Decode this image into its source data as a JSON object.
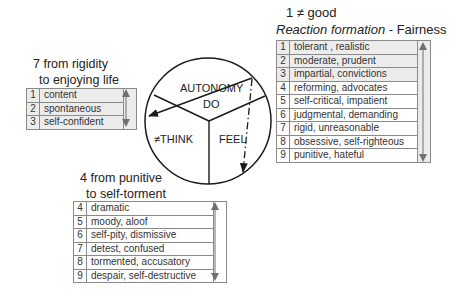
{
  "top_right": {
    "heading_line1": "1 ≠ good",
    "heading_italic": "Reaction formation",
    "heading_rest": " - Fairness",
    "rows": [
      {
        "num": "1",
        "text": "tolerant , realistic",
        "shaded": true
      },
      {
        "num": "2",
        "text": "moderate, prudent",
        "shaded": true
      },
      {
        "num": "3",
        "text": "impartial, convictions",
        "shaded": true
      },
      {
        "num": "4",
        "text": "reforming, advocates",
        "shaded": false
      },
      {
        "num": "5",
        "text": "self-critical, impatient",
        "shaded": false
      },
      {
        "num": "6",
        "text": "judgmental, demanding",
        "shaded": false
      },
      {
        "num": "7",
        "text": "rigid, unreasonable",
        "shaded": false
      },
      {
        "num": "8",
        "text": "obsessive, self-righteous",
        "shaded": false
      },
      {
        "num": "9",
        "text": "punitive, hateful",
        "shaded": false
      }
    ]
  },
  "left": {
    "heading_line1": "7 from rigidity",
    "heading_line2": "to enjoying life",
    "rows": [
      {
        "num": "1",
        "text": "content",
        "shaded": true
      },
      {
        "num": "2",
        "text": "spontaneous",
        "shaded": true
      },
      {
        "num": "3",
        "text": "self-confident",
        "shaded": true
      }
    ]
  },
  "bottom": {
    "heading_line1": "4 from punitive",
    "heading_line2": "to self-torment",
    "rows": [
      {
        "num": "4",
        "text": "dramatic",
        "shaded": false
      },
      {
        "num": "5",
        "text": "moody, aloof",
        "shaded": false
      },
      {
        "num": "6",
        "text": "self-pity, dismissive",
        "shaded": false
      },
      {
        "num": "7",
        "text": "detest, confused",
        "shaded": false
      },
      {
        "num": "8",
        "text": "tormented, accusatory",
        "shaded": false
      },
      {
        "num": "9",
        "text": "despair, self-destructive",
        "shaded": false
      }
    ]
  },
  "circle": {
    "top_label": "AUTONOMY",
    "do_label": "DO",
    "think_label": "≠THINK",
    "feel_label": "FEEL"
  },
  "colors": {
    "line": "#1a1a1a",
    "table_border": "#8a8a8a",
    "shade": "#ececec",
    "arrow": "#707070"
  }
}
